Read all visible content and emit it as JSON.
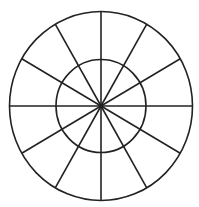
{
  "diagram": {
    "type": "polar-grid",
    "center": [
      101,
      106
    ],
    "outer_radius": [
      91.5,
      94.5
    ],
    "inner_radius": [
      45,
      46.5
    ],
    "spoke_count": 12,
    "spoke_angle_step_deg": 30,
    "stroke_color": "#222222",
    "stroke_width": 1.6,
    "background": "#ffffff"
  }
}
